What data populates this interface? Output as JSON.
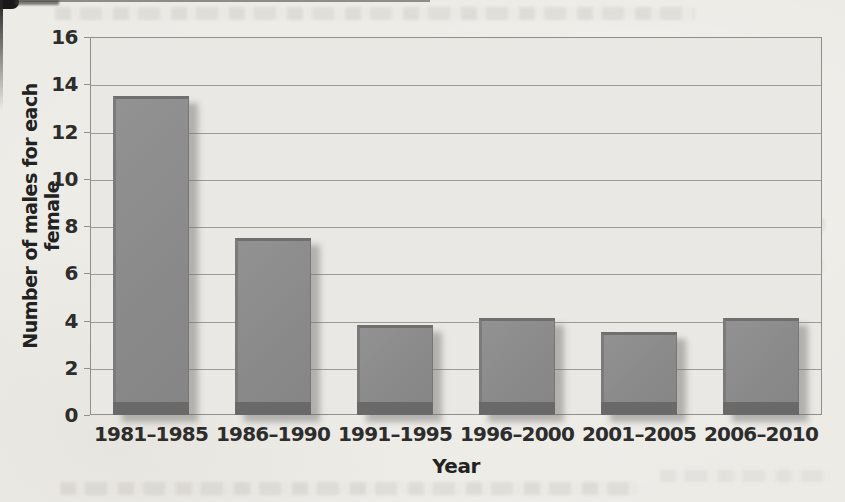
{
  "chart_data": {
    "type": "bar",
    "title": "",
    "xlabel": "Year",
    "ylabel": "Number of males for each female",
    "categories": [
      "1981–1985",
      "1986–1990",
      "1991–1995",
      "1996–2000",
      "2001–2005",
      "2006–2010"
    ],
    "values": [
      13.5,
      7.5,
      3.8,
      4.1,
      3.5,
      4.1
    ],
    "ylim": [
      0,
      16
    ],
    "yticks": [
      0,
      2,
      4,
      6,
      8,
      10,
      12,
      14,
      16
    ],
    "grid": "horizontal gridlines on",
    "legend": "none",
    "colors": {
      "bar_fill": "#8b8b8b",
      "bar_base_band": "#696969",
      "bar_bevel": "#6f6f6f",
      "plot_background": "#e9e8e4",
      "page_background": "#edebe6",
      "gridline": "#9b9b99",
      "axis_text": "#2d2d2d"
    }
  }
}
